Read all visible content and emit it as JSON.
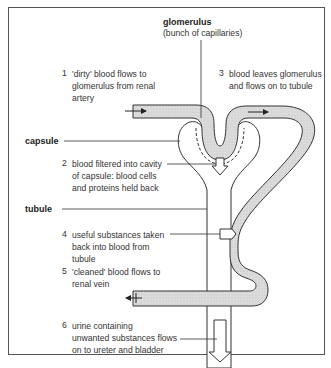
{
  "diagram": {
    "structures": {
      "glomerulus": {
        "name": "glomerulus",
        "note": "(bunch of capillaries)"
      },
      "capsule": {
        "name": "capsule"
      },
      "tubule": {
        "name": "tubule"
      }
    },
    "steps": [
      {
        "number": "1",
        "lines": [
          "'dirty' blood flows to",
          "glomerulus from renal",
          "artery"
        ]
      },
      {
        "number": "2",
        "lines": [
          "blood filtered into cavity",
          "of capsule: blood cells",
          "and proteins held back"
        ]
      },
      {
        "number": "3",
        "lines": [
          "blood leaves glomerulus",
          "and flows on to tubule"
        ]
      },
      {
        "number": "4",
        "lines": [
          "useful substances taken",
          "back into blood from",
          "tubule"
        ]
      },
      {
        "number": "5",
        "lines": [
          "'cleaned' blood flows to",
          "renal vein"
        ]
      },
      {
        "number": "6",
        "lines": [
          "urine containing",
          "unwanted substances flows",
          "on to ureter and bladder"
        ]
      }
    ],
    "colors": {
      "blood_vessel_fill": "#d9d9d9",
      "outline": "#333333",
      "background": "#ffffff"
    }
  }
}
